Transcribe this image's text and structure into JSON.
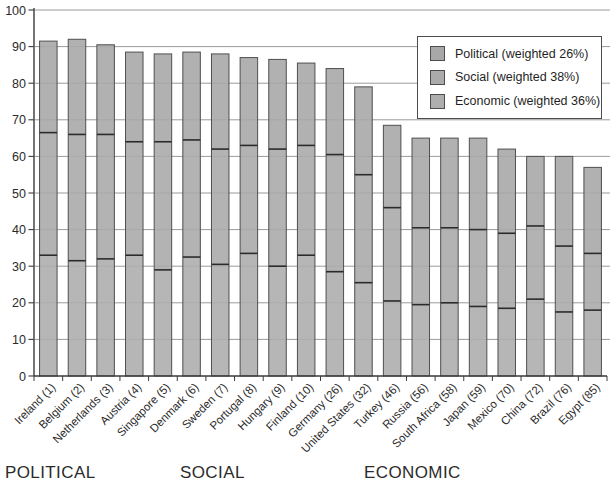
{
  "chart_data": {
    "type": "bar",
    "stacked": true,
    "title": "",
    "xlabel": "",
    "ylabel": "",
    "ylim": [
      0,
      100
    ],
    "ytick_step": 10,
    "grid": true,
    "legend_position": "top-right",
    "categories": [
      "Ireland (1)",
      "Belgium (2)",
      "Netherlands (3)",
      "Austria (4)",
      "Singapore (5)",
      "Denmark (6)",
      "Sweden (7)",
      "Portugal (8)",
      "Hungary (9)",
      "Finland (10)",
      "Germany (26)",
      "United States (32)",
      "Turkey (46)",
      "Russia (56)",
      "South Africa (58)",
      "Japan (59)",
      "Mexico (70)",
      "China (72)",
      "Brazil (76)",
      "Egypt (85)"
    ],
    "stack_order_bottom_to_top": [
      "Economic",
      "Social",
      "Political"
    ],
    "series": [
      {
        "name": "Economic",
        "color": "#aeaeae",
        "values": [
          33,
          31.5,
          32,
          33,
          29,
          32.5,
          30.5,
          33.5,
          30,
          33,
          28.5,
          25.5,
          20.5,
          19.5,
          20,
          19,
          18.5,
          21,
          17.5,
          18
        ]
      },
      {
        "name": "Social",
        "color": "#ababab",
        "values": [
          33.5,
          34.5,
          34,
          31,
          35,
          32,
          31.5,
          29.5,
          32,
          30,
          32,
          29.5,
          25.5,
          21,
          20.5,
          21,
          20.5,
          20,
          18,
          15.5
        ]
      },
      {
        "name": "Political",
        "color": "#a8a8a8",
        "values": [
          25,
          26,
          24.5,
          24.5,
          24,
          24,
          26,
          24,
          24.5,
          22.5,
          23.5,
          24,
          22.5,
          24.5,
          24.5,
          25,
          23,
          19,
          24.5,
          23.5
        ]
      }
    ],
    "totals": [
      91.5,
      92,
      90.5,
      88.5,
      88,
      88.5,
      88,
      87,
      86.5,
      85.5,
      84,
      79,
      68.5,
      65,
      65,
      65,
      62,
      60,
      60,
      57
    ]
  },
  "legend": {
    "items": [
      {
        "label": "Political (weighted 26%)",
        "color": "#a8a8a8"
      },
      {
        "label": "Social (weighted 38%)",
        "color": "#ababab"
      },
      {
        "label": "Economic (weighted 36%)",
        "color": "#aeaeae"
      }
    ]
  },
  "footer": {
    "labels": {
      "political": "POLITICAL",
      "social": "SOCIAL",
      "economic": "ECONOMIC"
    }
  },
  "colors": {
    "background": "#ffffff",
    "bar_fill": "#ababab",
    "bar_stroke": "#4f4f4f",
    "segment_divider": "#2b2b2b",
    "gridline": "#8f8f8f",
    "axis": "#3a3a3a",
    "text": "#2b2b2b"
  }
}
